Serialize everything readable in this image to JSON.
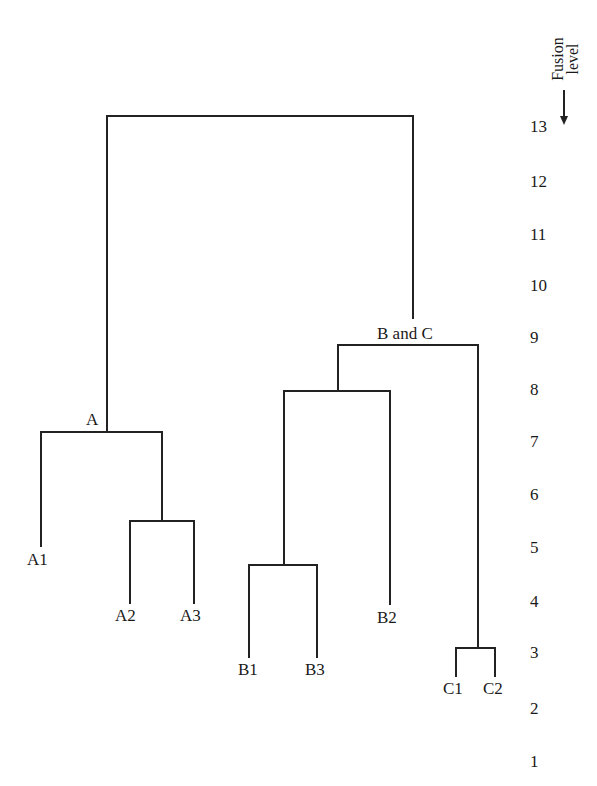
{
  "diagram": {
    "type": "dendrogram",
    "axis": {
      "title_line1": "Fusion",
      "title_line2": "level",
      "direction": "down",
      "ticks": [
        {
          "label": "13",
          "y": 127
        },
        {
          "label": "12",
          "y": 182
        },
        {
          "label": "11",
          "y": 235
        },
        {
          "label": "10",
          "y": 286
        },
        {
          "label": "9",
          "y": 338
        },
        {
          "label": "8",
          "y": 390
        },
        {
          "label": "7",
          "y": 442
        },
        {
          "label": "6",
          "y": 495
        },
        {
          "label": "5",
          "y": 548
        },
        {
          "label": "4",
          "y": 602
        },
        {
          "label": "3",
          "y": 653
        },
        {
          "label": "2",
          "y": 709
        },
        {
          "label": "1",
          "y": 762
        }
      ]
    },
    "cluster_labels": {
      "a": "A",
      "bc": "B and C"
    },
    "leaves": {
      "a1": "A1",
      "a2": "A2",
      "a3": "A3",
      "b1": "B1",
      "b2": "B2",
      "b3": "B3",
      "c1": "C1",
      "c2": "C2"
    },
    "merges": [
      {
        "members": [
          "C1",
          "C2"
        ],
        "fusion_level": 3
      },
      {
        "members": [
          "B1",
          "B3"
        ],
        "fusion_level": 4
      },
      {
        "members": [
          "A2",
          "A3"
        ],
        "fusion_level": 6
      },
      {
        "members": [
          "A1",
          "A2+A3"
        ],
        "label": "A",
        "fusion_level": 7
      },
      {
        "members": [
          "B1+B3",
          "B2"
        ],
        "fusion_level": 8
      },
      {
        "members": [
          "B",
          "C"
        ],
        "label": "B and C",
        "fusion_level": 9
      },
      {
        "members": [
          "A",
          "B and C"
        ],
        "fusion_level": 13
      }
    ],
    "line_color": "#222222"
  }
}
